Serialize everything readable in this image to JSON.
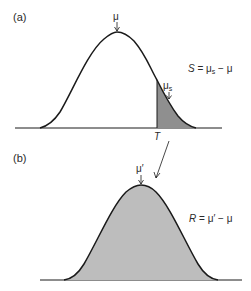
{
  "panel_a": {
    "label": "(a)",
    "mean_symbol": "μ",
    "selected_mean_symbol": "μ",
    "selected_mean_sub": "s",
    "threshold_label": "T",
    "equation": {
      "lhs": "S",
      "eq": " = ",
      "term1": "μ",
      "term1_sub": "s",
      "minus": " − ",
      "term2": "μ"
    }
  },
  "panel_b": {
    "label": "(b)",
    "mean_symbol": "μ′",
    "equation": {
      "lhs": "R",
      "eq": " = ",
      "term1": "μ′",
      "minus": " − ",
      "term2": "μ"
    }
  },
  "colors": {
    "line": "#1a1a1a",
    "shade": "#b3b3b3",
    "text": "#2a2a2a"
  }
}
